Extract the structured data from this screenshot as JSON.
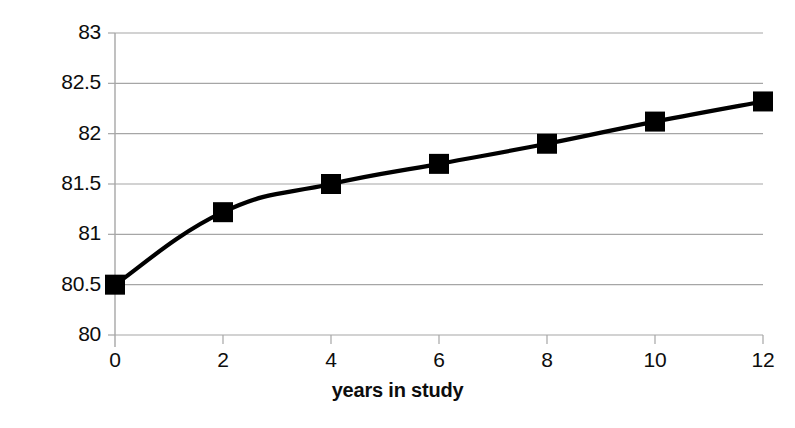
{
  "chart_data": {
    "type": "line",
    "title": "",
    "xlabel": "years in study",
    "ylabel": "strength",
    "x": [
      0,
      2,
      4,
      6,
      8,
      10,
      12
    ],
    "values": [
      80.5,
      81.22,
      81.5,
      81.7,
      81.9,
      82.12,
      82.32
    ],
    "series": [
      {
        "name": "strength",
        "values": [
          80.5,
          81.22,
          81.5,
          81.7,
          81.9,
          82.12,
          82.32
        ]
      }
    ],
    "xlim": [
      0,
      12
    ],
    "ylim": [
      80,
      83
    ],
    "xticks": [
      "0",
      "2",
      "4",
      "6",
      "8",
      "10",
      "12"
    ],
    "yticks": [
      "80",
      "80.5",
      "81",
      "81.5",
      "82",
      "82.5",
      "83"
    ],
    "grid": "horizontal",
    "legend": "none",
    "marker": "square",
    "line_color": "#000000",
    "marker_color": "#000000",
    "grid_color": "#a6a6a6",
    "background_color": "#ffffff"
  }
}
